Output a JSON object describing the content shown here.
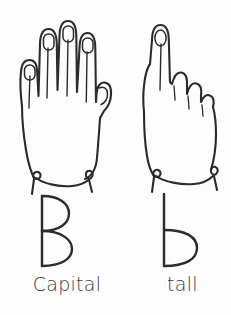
{
  "figure": {
    "style": "black and white line drawing",
    "background_color": "#fdfdfd",
    "ink_color": "#2b2b2d"
  },
  "panels": [
    {
      "id": "capital-b",
      "hand_sign": "open-hand-all-fingers-extended",
      "hand_description": "Open hand, palm forward, four fingers extended upward with fingernails showing and thumb at the side, wrist cuff band at the bottom",
      "letter": "B",
      "letter_case": "uppercase",
      "caption": "Capital"
    },
    {
      "id": "tall-b",
      "hand_sign": "fist-index-finger-extended",
      "hand_description": "Closed fist with only the index finger extended upward showing a fingernail, knuckles curled on the right, wrist cuff band at the bottom",
      "letter": "b",
      "letter_case": "lowercase",
      "caption": "tall"
    }
  ]
}
